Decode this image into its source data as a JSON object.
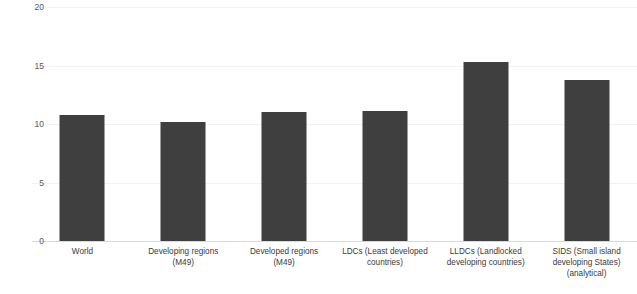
{
  "chart_data": {
    "type": "bar",
    "title": "",
    "subtitle": "",
    "xlabel": "",
    "ylabel": "",
    "ylim": [
      0,
      20
    ],
    "yticks": [
      0,
      5,
      10,
      15,
      20
    ],
    "ytick_labels": [
      "0",
      "5",
      "10",
      "15",
      "20"
    ],
    "grid": true,
    "legend": null,
    "bar_color": "#3f3f3f",
    "gridline_color": "#f2f2f2",
    "axis_line_color": "#d9d9d9",
    "tick_label_color": "#595959",
    "category_label_color": "#3a3a3a",
    "categories": [
      "World",
      "Developing regions (M49)",
      "Developed regions (M49)",
      "LDCs (Least developed countries)",
      "LLDCs (Landlocked developing countries)",
      "SIDS (Small island developing States) (analytical)"
    ],
    "values": [
      10.8,
      10.2,
      11.0,
      11.1,
      15.3,
      13.8
    ],
    "bars": [
      {
        "label": "World",
        "label_lines": [
          "World"
        ],
        "value": 10.8
      },
      {
        "label": "Developing regions (M49)",
        "label_lines": [
          "Developing regions",
          "(M49)"
        ],
        "value": 10.2
      },
      {
        "label": "Developed regions (M49)",
        "label_lines": [
          "Developed regions",
          "(M49)"
        ],
        "value": 11.0
      },
      {
        "label": "LDCs (Least developed countries)",
        "label_lines": [
          "LDCs (Least developed",
          "countries)"
        ],
        "value": 11.1
      },
      {
        "label": "LLDCs (Landlocked developing countries)",
        "label_lines": [
          "LLDCs (Landlocked",
          "developing countries)"
        ],
        "value": 15.3
      },
      {
        "label": "SIDS (Small island developing States) (analytical)",
        "label_lines": [
          "SIDS (Small island",
          "developing States)",
          "(analytical)"
        ],
        "value": 13.8
      }
    ]
  }
}
